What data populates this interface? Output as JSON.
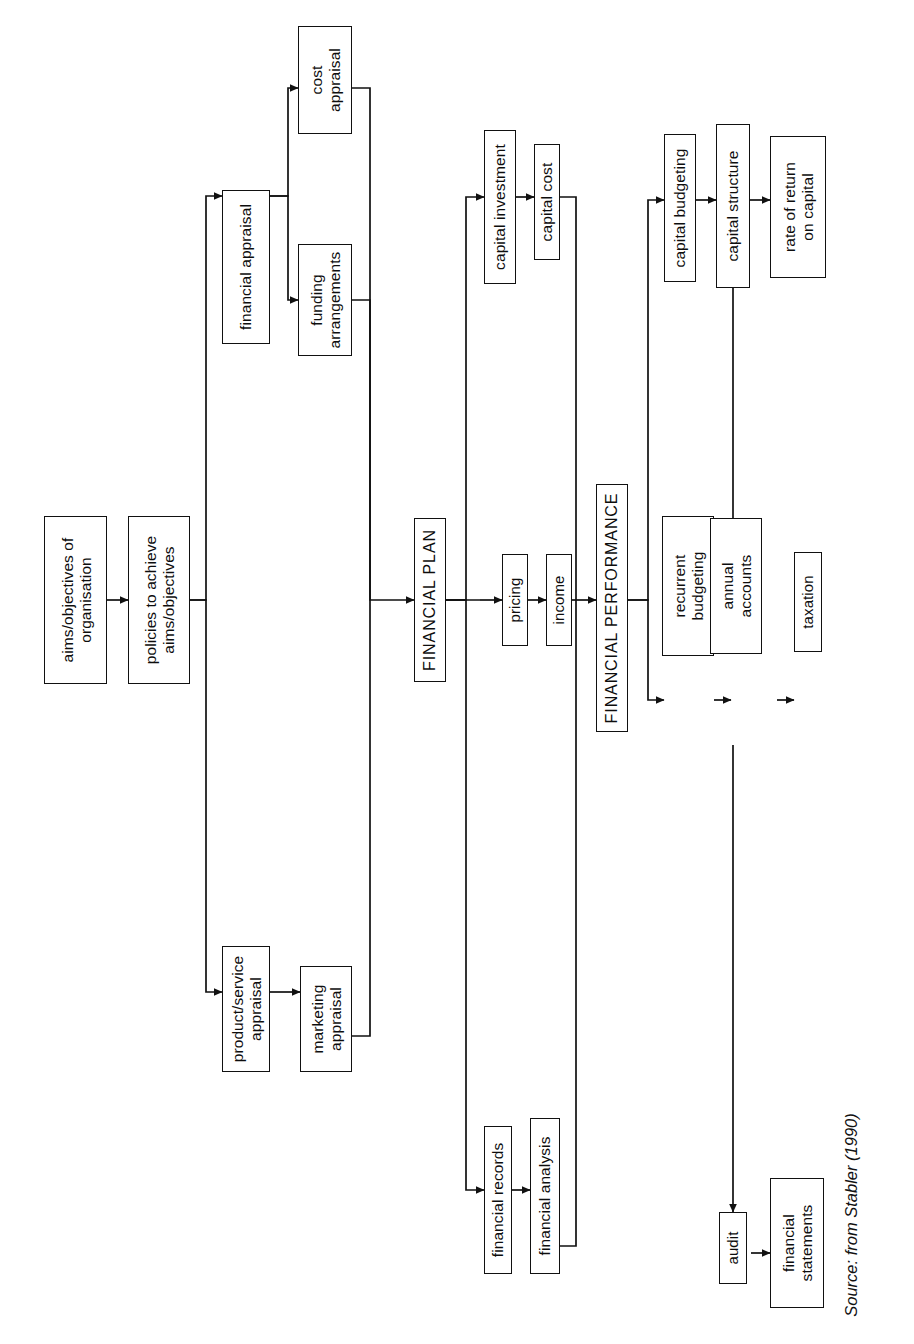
{
  "figure": {
    "orientation": "rotated-90-ccw",
    "source_note": "Source: from Stabler (1990)",
    "line_color": "#111111",
    "box_fill": "#ffffff"
  },
  "nodes": {
    "aims_objectives": {
      "label": "aims/objectives of\norganisation"
    },
    "policies": {
      "label": "policies to achieve\naims/objectives"
    },
    "financial_appraisal": {
      "label": "financial appraisal"
    },
    "cost_appraisal": {
      "label": "cost\nappraisal"
    },
    "funding_arrangements": {
      "label": "funding\narrangements"
    },
    "product_service": {
      "label": "product/service\nappraisal"
    },
    "marketing_appraisal": {
      "label": "marketing\nappraisal"
    },
    "financial_plan": {
      "label": "FINANCIAL PLAN"
    },
    "capital_investment": {
      "label": "capital investment"
    },
    "capital_cost": {
      "label": "capital cost"
    },
    "pricing": {
      "label": "pricing"
    },
    "income": {
      "label": "income"
    },
    "financial_records": {
      "label": "financial records"
    },
    "financial_analysis": {
      "label": "financial analysis"
    },
    "financial_performance": {
      "label": "FINANCIAL PERFORMANCE"
    },
    "capital_budgeting": {
      "label": "capital budgeting"
    },
    "capital_structure": {
      "label": "capital structure"
    },
    "rate_of_return": {
      "label": "rate of return\non capital"
    },
    "recurrent_budgeting": {
      "label": "recurrent\nbudgeting"
    },
    "annual_accounts": {
      "label": "annual\naccounts"
    },
    "taxation": {
      "label": "taxation"
    },
    "audit": {
      "label": "audit"
    },
    "financial_statements": {
      "label": "financial\nstatements"
    }
  },
  "edges": [
    {
      "from": "aims_objectives",
      "to": "policies"
    },
    {
      "from": "policies",
      "to": "financial_appraisal"
    },
    {
      "from": "policies",
      "to": "product_service"
    },
    {
      "from": "financial_appraisal",
      "to": "cost_appraisal"
    },
    {
      "from": "financial_appraisal",
      "to": "funding_arrangements"
    },
    {
      "from": "product_service",
      "to": "marketing_appraisal"
    },
    {
      "from": "cost_appraisal",
      "to": "financial_plan"
    },
    {
      "from": "funding_arrangements",
      "to": "financial_plan"
    },
    {
      "from": "marketing_appraisal",
      "to": "financial_plan"
    },
    {
      "from": "financial_plan",
      "to": "capital_investment"
    },
    {
      "from": "financial_plan",
      "to": "pricing"
    },
    {
      "from": "financial_plan",
      "to": "financial_records"
    },
    {
      "from": "capital_investment",
      "to": "capital_cost"
    },
    {
      "from": "pricing",
      "to": "income"
    },
    {
      "from": "financial_records",
      "to": "financial_analysis"
    },
    {
      "from": "capital_cost",
      "to": "financial_performance"
    },
    {
      "from": "income",
      "to": "financial_performance"
    },
    {
      "from": "financial_analysis",
      "to": "financial_performance"
    },
    {
      "from": "financial_performance",
      "to": "capital_budgeting"
    },
    {
      "from": "financial_performance",
      "to": "recurrent_budgeting"
    },
    {
      "from": "capital_budgeting",
      "to": "capital_structure"
    },
    {
      "from": "capital_structure",
      "to": "rate_of_return"
    },
    {
      "from": "capital_structure",
      "to": "annual_accounts"
    },
    {
      "from": "recurrent_budgeting",
      "to": "annual_accounts"
    },
    {
      "from": "annual_accounts",
      "to": "taxation"
    },
    {
      "from": "annual_accounts",
      "to": "audit"
    },
    {
      "from": "audit",
      "to": "financial_statements"
    }
  ]
}
